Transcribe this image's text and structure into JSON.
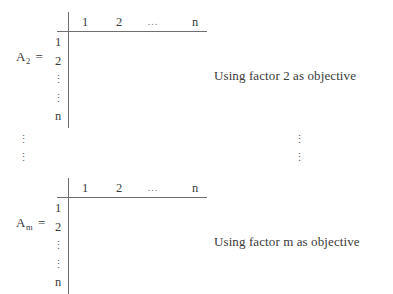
{
  "figure": {
    "matrices": [
      {
        "label": "A",
        "subscript": "2",
        "equals": "=",
        "column_headers": [
          "1",
          "2",
          "...",
          "n"
        ],
        "row_headers": [
          "1",
          "2",
          "⋮",
          "⋮",
          "n"
        ],
        "caption": "Using factor 2 as objective"
      },
      {
        "label": "A",
        "subscript": "m",
        "equals": "=",
        "column_headers": [
          "1",
          "2",
          "...",
          "n"
        ],
        "row_headers": [
          "1",
          "2",
          "⋮",
          "⋮",
          "n"
        ],
        "caption": "Using factor m as objective"
      }
    ],
    "ellipses": {
      "left_upper": "⋮",
      "left_lower": "⋮",
      "right_upper": "⋮",
      "right_lower": "⋮"
    },
    "colors": {
      "background": "#ffffff",
      "text": "#3a3a3a",
      "rule": "#6f6f6f",
      "dots": "#6a6a6a"
    }
  }
}
